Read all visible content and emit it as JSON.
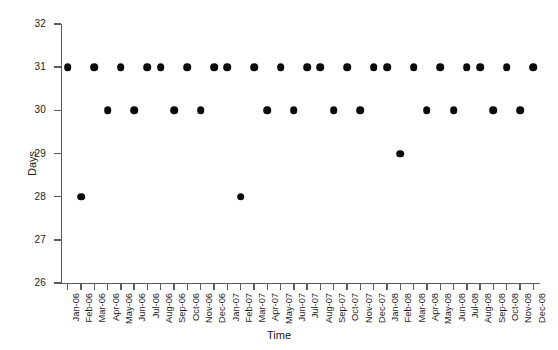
{
  "chart_data": {
    "type": "scatter",
    "title": "",
    "xlabel": "Time",
    "ylabel": "Days",
    "ylim": [
      26,
      32
    ],
    "yticks": [
      26,
      27,
      28,
      29,
      30,
      31,
      32
    ],
    "grid": false,
    "legend": "none",
    "marker": "filled-circle",
    "marker_color": "#0a0a0a",
    "categories": [
      "Jan-06",
      "Feb-06",
      "Mar-06",
      "Apr-06",
      "May-06",
      "Jun-06",
      "Jul-06",
      "Aug-06",
      "Sep-06",
      "Oct-06",
      "Nov-06",
      "Dec-06",
      "Jan-07",
      "Feb-07",
      "Mar-07",
      "Apr-07",
      "May-07",
      "Jun-07",
      "Jul-07",
      "Aug-07",
      "Sep-07",
      "Oct-07",
      "Nov-07",
      "Dec-07",
      "Jan-08",
      "Feb-08",
      "Mar-08",
      "Apr-08",
      "May-08",
      "Jun-08",
      "Jul-08",
      "Aug-08",
      "Sep-08",
      "Oct-08",
      "Nov-08",
      "Dec-08"
    ],
    "values": [
      31,
      28,
      31,
      30,
      31,
      30,
      31,
      31,
      30,
      31,
      30,
      31,
      31,
      28,
      31,
      30,
      31,
      30,
      31,
      31,
      30,
      31,
      30,
      31,
      31,
      29,
      31,
      30,
      31,
      30,
      31,
      31,
      30,
      31,
      30,
      31
    ]
  },
  "layout": {
    "plot_left": 61,
    "plot_right": 540,
    "plot_top": 24,
    "plot_bottom": 283
  }
}
